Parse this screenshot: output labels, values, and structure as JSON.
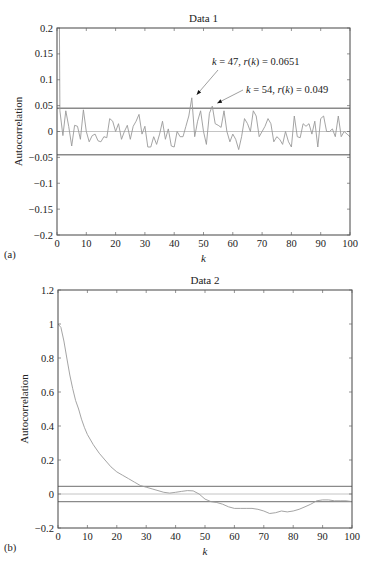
{
  "chart_data": [
    {
      "panel_label": "(a)",
      "type": "line",
      "title": "Data 1",
      "xlabel": "k",
      "ylabel": "Autocorrelation",
      "xlim": [
        0,
        100
      ],
      "ylim": [
        -0.2,
        0.2
      ],
      "xticks": [
        "0",
        "10",
        "20",
        "30",
        "40",
        "50",
        "60",
        "70",
        "80",
        "90",
        "100"
      ],
      "yticks": [
        "0.2",
        "0.15",
        "0.1",
        "0.05",
        "0",
        "−0.05",
        "−0.1",
        "−0.15",
        "−0.2"
      ],
      "ytick_values": [
        0.2,
        0.15,
        0.1,
        0.05,
        0,
        -0.05,
        -0.1,
        -0.15,
        -0.2
      ],
      "grid": false,
      "confidence_bounds": [
        0.045,
        -0.045
      ],
      "zero_line": 0,
      "annotations": [
        {
          "text": "k = 47, r(k) = 0.0651",
          "k": 47,
          "r": 0.0651
        },
        {
          "text": "k = 54, r(k) = 0.049",
          "k": 54,
          "r": 0.049
        }
      ],
      "x": [
        0,
        1,
        2,
        3,
        4,
        5,
        6,
        7,
        8,
        9,
        10,
        11,
        12,
        13,
        14,
        15,
        16,
        17,
        18,
        19,
        20,
        21,
        22,
        23,
        24,
        25,
        26,
        27,
        28,
        29,
        30,
        31,
        32,
        33,
        34,
        35,
        36,
        37,
        38,
        39,
        40,
        41,
        42,
        43,
        44,
        45,
        46,
        47,
        48,
        49,
        50,
        51,
        52,
        53,
        54,
        55,
        56,
        57,
        58,
        59,
        60,
        61,
        62,
        63,
        64,
        65,
        66,
        67,
        68,
        69,
        70,
        71,
        72,
        73,
        74,
        75,
        76,
        77,
        78,
        79,
        80,
        81,
        82,
        83,
        84,
        85,
        86,
        87,
        88,
        89,
        90,
        91,
        92,
        93,
        94,
        95,
        96,
        97,
        98,
        99,
        100
      ],
      "values": [
        1.0,
        0.04,
        -0.008,
        0.04,
        0.01,
        -0.028,
        0.012,
        0.01,
        -0.015,
        0.042,
        0.0,
        -0.02,
        -0.008,
        -0.005,
        -0.018,
        -0.02,
        -0.01,
        -0.012,
        0.025,
        0.02,
        0.0,
        0.015,
        -0.015,
        0.0,
        0.012,
        -0.015,
        0.01,
        0.02,
        0.033,
        -0.005,
        0.01,
        -0.03,
        -0.03,
        -0.01,
        -0.025,
        -0.005,
        0.02,
        -0.015,
        0.005,
        -0.028,
        -0.03,
        0.0,
        -0.01,
        -0.01,
        0.01,
        0.03,
        0.0651,
        -0.01,
        0.02,
        0.04,
        0.0,
        -0.025,
        0.035,
        0.049,
        0.015,
        0.012,
        0.008,
        0.04,
        0.0,
        -0.02,
        -0.005,
        -0.015,
        -0.035,
        -0.01,
        0.025,
        0.015,
        0.0,
        0.04,
        0.03,
        -0.01,
        0.0,
        0.01,
        0.025,
        0.015,
        -0.02,
        -0.01,
        -0.015,
        -0.025,
        0.0,
        -0.02,
        -0.03,
        0.03,
        -0.01,
        -0.012,
        0.015,
        0.01,
        0.015,
        -0.005,
        0.02,
        -0.03,
        0.025,
        0.03,
        0.0,
        0.0,
        0.005,
        -0.01,
        0.03,
        -0.01,
        0.0,
        -0.005,
        -0.01
      ]
    },
    {
      "panel_label": "(b)",
      "type": "line",
      "title": "Data 2",
      "xlabel": "k",
      "ylabel": "Autocorrelation",
      "xlim": [
        0,
        100
      ],
      "ylim": [
        -0.2,
        1.2
      ],
      "xticks": [
        "0",
        "10",
        "20",
        "30",
        "40",
        "50",
        "60",
        "70",
        "80",
        "90",
        "100"
      ],
      "yticks": [
        "1.2",
        "1",
        "0.8",
        "0.6",
        "0.4",
        "0.2",
        "0",
        "−0.2"
      ],
      "ytick_values": [
        1.2,
        1.0,
        0.8,
        0.6,
        0.4,
        0.2,
        0,
        -0.2
      ],
      "grid": false,
      "confidence_bounds": [
        0.045,
        -0.045
      ],
      "zero_line": 0,
      "x": [
        0,
        1,
        2,
        3,
        4,
        5,
        6,
        7,
        8,
        9,
        10,
        12,
        14,
        16,
        18,
        20,
        22,
        24,
        26,
        28,
        30,
        32,
        34,
        36,
        38,
        40,
        42,
        44,
        46,
        48,
        50,
        52,
        54,
        56,
        58,
        60,
        62,
        64,
        66,
        68,
        70,
        72,
        74,
        76,
        78,
        80,
        82,
        84,
        86,
        88,
        90,
        92,
        94,
        96,
        98,
        100
      ],
      "values": [
        1.0,
        0.98,
        0.9,
        0.8,
        0.7,
        0.62,
        0.55,
        0.5,
        0.44,
        0.39,
        0.35,
        0.29,
        0.24,
        0.2,
        0.16,
        0.13,
        0.11,
        0.09,
        0.07,
        0.05,
        0.04,
        0.03,
        0.02,
        0.01,
        0.005,
        0.01,
        0.015,
        0.02,
        0.018,
        0.0,
        -0.03,
        -0.045,
        -0.05,
        -0.06,
        -0.075,
        -0.085,
        -0.085,
        -0.085,
        -0.085,
        -0.09,
        -0.1,
        -0.115,
        -0.11,
        -0.1,
        -0.105,
        -0.1,
        -0.09,
        -0.075,
        -0.06,
        -0.04,
        -0.035,
        -0.035,
        -0.04,
        -0.04,
        -0.04,
        -0.045
      ]
    }
  ]
}
